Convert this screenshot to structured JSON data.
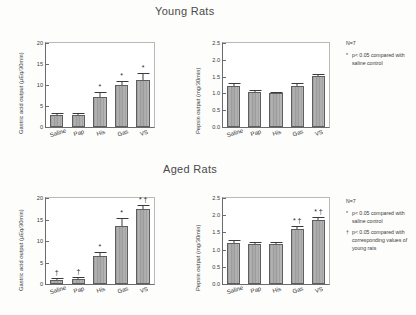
{
  "figure": {
    "panels": [
      {
        "title": "Young Rats"
      },
      {
        "title": "Aged Rats"
      }
    ]
  },
  "axes": {
    "gastric_label": "Gastric acid output  (µEq/30min)",
    "pepsin_label": "Pepsin output  (mg/30min)",
    "gastric_ticks": [
      "0",
      "5",
      "10",
      "15",
      "20"
    ],
    "pepsin_ticks": [
      "0.0",
      "0.5",
      "1.0",
      "1.5",
      "2.0",
      "2.5"
    ],
    "categories": [
      "Saline",
      "Pap",
      "His",
      "Gas",
      "VS"
    ]
  },
  "legend_young": {
    "n": "N=7",
    "rows": [
      {
        "marker": "*",
        "text": "p< 0.05 compared with saline control"
      }
    ]
  },
  "legend_aged": {
    "n": "N=7",
    "rows": [
      {
        "marker": "*",
        "text": "p< 0.05 compared with saline control"
      },
      {
        "marker": "†",
        "text": "p< 0.05 compared with corresponding values of young rats"
      }
    ]
  },
  "chart_data": [
    {
      "type": "bar",
      "title": "Young Rats",
      "panel": "young-gastric",
      "xlabel": "",
      "ylabel": "Gastric acid output  (µEq/30min)",
      "ylim": [
        0,
        20
      ],
      "yticks": [
        0,
        5,
        10,
        15,
        20
      ],
      "grid": false,
      "categories": [
        "Saline",
        "Pap",
        "His",
        "Gas",
        "VS"
      ],
      "values": [
        2.9,
        2.9,
        7.2,
        10.0,
        11.3
      ],
      "errors": [
        0.4,
        0.5,
        1.1,
        0.9,
        1.6
      ],
      "annotations": [
        "",
        "",
        "*",
        "*",
        "*"
      ]
    },
    {
      "type": "bar",
      "title": "Young Rats",
      "panel": "young-pepsin",
      "xlabel": "",
      "ylabel": "Pepsin output  (mg/30min)",
      "ylim": [
        0,
        2.5
      ],
      "yticks": [
        0.0,
        0.5,
        1.0,
        1.5,
        2.0,
        2.5
      ],
      "grid": false,
      "categories": [
        "Saline",
        "Pap",
        "His",
        "Gas",
        "VS"
      ],
      "values": [
        1.21,
        1.03,
        1.0,
        1.22,
        1.52
      ],
      "errors": [
        0.1,
        0.07,
        0.04,
        0.09,
        0.07
      ],
      "annotations": [
        "",
        "",
        "",
        "",
        ""
      ]
    },
    {
      "type": "bar",
      "title": "Aged Rats",
      "panel": "aged-gastric",
      "xlabel": "",
      "ylabel": "Gastric acid output  (µEq/30min)",
      "ylim": [
        0,
        20
      ],
      "yticks": [
        0,
        5,
        10,
        15,
        20
      ],
      "grid": false,
      "categories": [
        "Saline",
        "Pap",
        "His",
        "Gas",
        "VS"
      ],
      "values": [
        1.0,
        1.2,
        6.5,
        13.5,
        17.5
      ],
      "errors": [
        0.3,
        0.35,
        1.0,
        1.9,
        0.8
      ],
      "annotations": [
        "†",
        "†",
        "*",
        "*",
        "* †"
      ]
    },
    {
      "type": "bar",
      "title": "Aged Rats",
      "panel": "aged-pepsin",
      "xlabel": "",
      "ylabel": "Pepsin output  (mg/30min)",
      "ylim": [
        0,
        2.5
      ],
      "yticks": [
        0.0,
        0.5,
        1.0,
        1.5,
        2.0,
        2.5
      ],
      "grid": false,
      "categories": [
        "Saline",
        "Pap",
        "His",
        "Gas",
        "VS"
      ],
      "values": [
        1.2,
        1.15,
        1.15,
        1.6,
        1.85
      ],
      "errors": [
        0.07,
        0.07,
        0.07,
        0.1,
        0.1
      ],
      "annotations": [
        "",
        "",
        "",
        "* †",
        "* †"
      ]
    }
  ]
}
